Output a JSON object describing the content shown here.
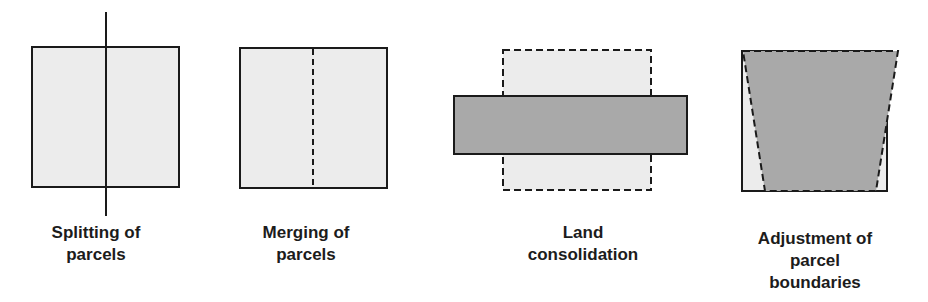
{
  "colors": {
    "light_fill": "#ececec",
    "dark_fill": "#a9a9a9",
    "stroke": "#1a1a1a"
  },
  "panels": [
    {
      "id": "splitting",
      "label_line1": "Splitting of",
      "label_line2": "parcels",
      "label_line3": ""
    },
    {
      "id": "merging",
      "label_line1": "Merging of",
      "label_line2": "parcels",
      "label_line3": ""
    },
    {
      "id": "consolidation",
      "label_line1": "Land",
      "label_line2": "consolidation",
      "label_line3": ""
    },
    {
      "id": "adjustment",
      "label_line1": "Adjustment of",
      "label_line2": "parcel",
      "label_line3": "boundaries"
    }
  ]
}
